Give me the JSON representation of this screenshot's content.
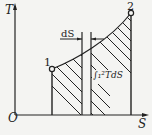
{
  "diagram": {
    "type": "T-S diagram",
    "axes": {
      "y_label": "T",
      "x_label": "S",
      "origin_label": "O"
    },
    "points": [
      {
        "id": "point-1",
        "label": "1"
      },
      {
        "id": "point-2",
        "label": "2"
      }
    ],
    "annotations": {
      "strip_label": "dS",
      "area_label": "∫₁²TdS"
    },
    "colors": {
      "line": "#222222",
      "background": "#f4f4f2"
    }
  }
}
